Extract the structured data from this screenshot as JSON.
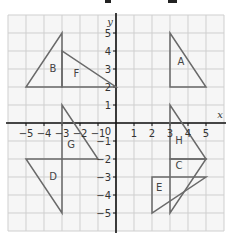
{
  "diagram": {
    "axes": {
      "x_label": "x",
      "y_label": "y",
      "origin_label": "0",
      "x_ticks": [
        "−5",
        "−4",
        "−3",
        "−2",
        "−1",
        "1",
        "2",
        "3",
        "4",
        "5"
      ],
      "x_tick_values": [
        -5,
        -4,
        -3,
        -2,
        -1,
        1,
        2,
        3,
        4,
        5
      ],
      "y_ticks": [
        "5",
        "4",
        "3",
        "2",
        "1",
        "−1",
        "−2",
        "−3",
        "−4",
        "−5"
      ],
      "y_tick_values": [
        5,
        4,
        3,
        2,
        1,
        -1,
        -2,
        -3,
        -4,
        -5
      ],
      "range": {
        "x": [
          -6,
          6
        ],
        "y": [
          -6,
          6
        ]
      }
    },
    "colors": {
      "background": "#ffffff",
      "grid_fill": "#f6f6f6",
      "grid_line": "#cfcfcf",
      "axis": "#111111",
      "shape_line": "#6a6a6a",
      "label": "#444444"
    },
    "shapes": [
      {
        "name": "A",
        "label": "A",
        "vertices": [
          [
            3,
            5
          ],
          [
            3,
            2
          ],
          [
            5,
            2
          ]
        ],
        "label_pos": [
          3.6,
          3.4
        ]
      },
      {
        "name": "B",
        "label": "B",
        "vertices": [
          [
            -3,
            5
          ],
          [
            -5,
            2
          ],
          [
            -3,
            2
          ]
        ],
        "label_pos": [
          -3.5,
          3.0
        ]
      },
      {
        "name": "F",
        "label": "F",
        "vertices": [
          [
            -3,
            4
          ],
          [
            -3,
            2
          ],
          [
            0,
            2
          ]
        ],
        "label_pos": [
          -2.2,
          2.7
        ]
      },
      {
        "name": "G",
        "label": "G",
        "vertices": [
          [
            -3,
            1
          ],
          [
            -3,
            -2
          ],
          [
            -1,
            -2
          ]
        ],
        "label_pos": [
          -2.5,
          -1.2
        ]
      },
      {
        "name": "D",
        "label": "D",
        "vertices": [
          [
            -5,
            -2
          ],
          [
            -3,
            -2
          ],
          [
            -3,
            -5
          ]
        ],
        "label_pos": [
          -3.5,
          -3.0
        ]
      },
      {
        "name": "H",
        "label": "H",
        "vertices": [
          [
            3,
            1
          ],
          [
            3,
            -2
          ],
          [
            5,
            -2
          ]
        ],
        "label_pos": [
          3.5,
          -1.0
        ]
      },
      {
        "name": "C",
        "label": "C",
        "vertices": [
          [
            3,
            -2
          ],
          [
            5,
            -2
          ],
          [
            3,
            -5
          ]
        ],
        "label_pos": [
          3.5,
          -2.4
        ]
      },
      {
        "name": "E",
        "label": "E",
        "vertices": [
          [
            2,
            -3
          ],
          [
            5,
            -3
          ],
          [
            2,
            -5
          ]
        ],
        "label_pos": [
          2.4,
          -3.6
        ]
      }
    ]
  }
}
